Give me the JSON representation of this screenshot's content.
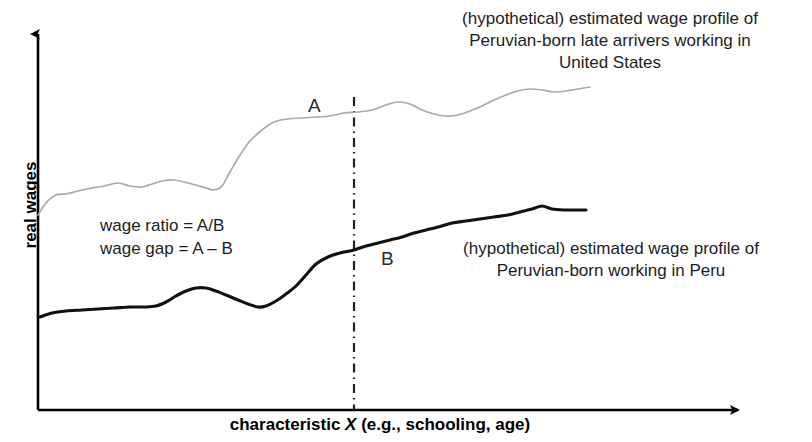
{
  "chart_data": {
    "type": "line",
    "title": "",
    "xlabel": "characteristic X (e.g., schooling, age)",
    "xlabel_prefix": "characteristic ",
    "xlabel_variable": "X",
    "xlabel_suffix": " (e.g., schooling, age)",
    "ylabel": "real wages",
    "grid": false,
    "legend": "inline-annotations",
    "axes": {
      "x_axis_arrow": true,
      "y_axis_arrow": true,
      "x_tick_labels": [],
      "y_tick_labels": [],
      "xlim_note": "unlabeled, schematic",
      "ylim_note": "unlabeled, schematic"
    },
    "annotations": [
      {
        "name": "curve-a-label",
        "text": "A",
        "refers_to": "upper curve"
      },
      {
        "name": "curve-b-label",
        "text": "B",
        "refers_to": "lower curve"
      },
      {
        "name": "wage-ratio",
        "text": "wage ratio = A/B"
      },
      {
        "name": "wage-gap",
        "text": "wage gap = A – B"
      },
      {
        "name": "reference-line",
        "text": "vertical dash-dot reference line at a fixed characteristic X"
      }
    ],
    "series": [
      {
        "name": "A",
        "label": "(hypothetical) estimated wage profile of Peruvian-born late arrivers working in United States",
        "color": "#a9a9a9",
        "style": "solid-thin",
        "points": [
          [
            38,
            215
          ],
          [
            46,
            203
          ],
          [
            56,
            195
          ],
          [
            66,
            194
          ],
          [
            78,
            191
          ],
          [
            92,
            188
          ],
          [
            104,
            186
          ],
          [
            118,
            183
          ],
          [
            130,
            186
          ],
          [
            142,
            187
          ],
          [
            152,
            184
          ],
          [
            162,
            181
          ],
          [
            174,
            180
          ],
          [
            184,
            182
          ],
          [
            196,
            185
          ],
          [
            206,
            188
          ],
          [
            214,
            190
          ],
          [
            222,
            186
          ],
          [
            230,
            172
          ],
          [
            240,
            155
          ],
          [
            250,
            141
          ],
          [
            262,
            130
          ],
          [
            274,
            122
          ],
          [
            288,
            119
          ],
          [
            302,
            118
          ],
          [
            316,
            117
          ],
          [
            330,
            116
          ],
          [
            344,
            113
          ],
          [
            358,
            112
          ],
          [
            372,
            110
          ],
          [
            386,
            105
          ],
          [
            398,
            102
          ],
          [
            410,
            104
          ],
          [
            422,
            110
          ],
          [
            434,
            114
          ],
          [
            446,
            116
          ],
          [
            458,
            115
          ],
          [
            470,
            111
          ],
          [
            482,
            106
          ],
          [
            494,
            100
          ],
          [
            506,
            95
          ],
          [
            518,
            91
          ],
          [
            530,
            89
          ],
          [
            542,
            90
          ],
          [
            554,
            92
          ],
          [
            566,
            91
          ],
          [
            578,
            89
          ],
          [
            590,
            87
          ]
        ]
      },
      {
        "name": "B",
        "label": "(hypothetical) estimated wage profile of Peruvian-born working in Peru",
        "color": "#111111",
        "style": "solid-thick",
        "points": [
          [
            40,
            317
          ],
          [
            52,
            313
          ],
          [
            66,
            311
          ],
          [
            82,
            310
          ],
          [
            98,
            309
          ],
          [
            114,
            308
          ],
          [
            130,
            307
          ],
          [
            144,
            307
          ],
          [
            156,
            306
          ],
          [
            166,
            302
          ],
          [
            176,
            296
          ],
          [
            186,
            291
          ],
          [
            196,
            288
          ],
          [
            206,
            288
          ],
          [
            216,
            291
          ],
          [
            226,
            295
          ],
          [
            238,
            300
          ],
          [
            248,
            304
          ],
          [
            258,
            307
          ],
          [
            266,
            306
          ],
          [
            276,
            301
          ],
          [
            286,
            294
          ],
          [
            296,
            286
          ],
          [
            306,
            275
          ],
          [
            316,
            264
          ],
          [
            328,
            257
          ],
          [
            340,
            253
          ],
          [
            354,
            250
          ],
          [
            366,
            246
          ],
          [
            378,
            243
          ],
          [
            390,
            240
          ],
          [
            402,
            237
          ],
          [
            414,
            233
          ],
          [
            426,
            230
          ],
          [
            438,
            227
          ],
          [
            452,
            223
          ],
          [
            466,
            221
          ],
          [
            480,
            219
          ],
          [
            494,
            217
          ],
          [
            508,
            215
          ],
          [
            520,
            212
          ],
          [
            532,
            209
          ],
          [
            542,
            206
          ],
          [
            552,
            209
          ],
          [
            564,
            210
          ],
          [
            576,
            210
          ],
          [
            586,
            210
          ]
        ]
      }
    ],
    "reference_line": {
      "x": 354,
      "y_top": 97,
      "y_bottom": 410,
      "style": "dash-dot",
      "color": "#222222"
    },
    "colors": {
      "background": "#ffffff",
      "axis": "#000000",
      "curve_a": "#a9a9a9",
      "curve_b": "#111111",
      "text": "#1d1d1d"
    }
  },
  "annotations_text": {
    "us_profile": "(hypothetical) estimated wage profile of\nPeruvian-born late arrivers working in\nUnited States",
    "peru_profile": "(hypothetical) estimated wage profile of\nPeruvian-born working in Peru",
    "formulas": "wage ratio = A/B\nwage gap = A – B",
    "label_a": "A",
    "label_b": "B"
  },
  "axis_titles": {
    "x_prefix": "characteristic ",
    "x_variable": "X",
    "x_suffix": " (e.g., schooling, age)",
    "y": "real wages"
  }
}
